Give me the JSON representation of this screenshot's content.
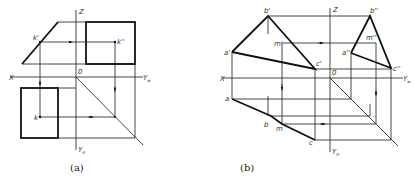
{
  "figure_a": {
    "caption": "(a)",
    "axes": {
      "x": "X",
      "z": "Z",
      "origin": "0",
      "yw": "Y",
      "yw_sub": "w",
      "yh": "Y",
      "yh_sub": "H"
    },
    "points": {
      "front": "k'",
      "side": "k''",
      "top": "k"
    }
  },
  "figure_b": {
    "caption": "(b)",
    "axes": {
      "x": "X",
      "z": "Z",
      "origin": "0",
      "yw": "Y",
      "yw_sub": "w",
      "yh": "Y",
      "yh_sub": "H"
    },
    "points": {
      "a_front": "a'",
      "b_front": "b'",
      "c_front": "c'",
      "m_front": "m'",
      "a_side": "a''",
      "b_side": "b''",
      "c_side": "c''",
      "m_side": "m''",
      "a_top": "a",
      "b_top": "b",
      "c_top": "c",
      "m_top": "m"
    }
  },
  "colors": {
    "line": "#111111",
    "background": "#ffffff"
  }
}
